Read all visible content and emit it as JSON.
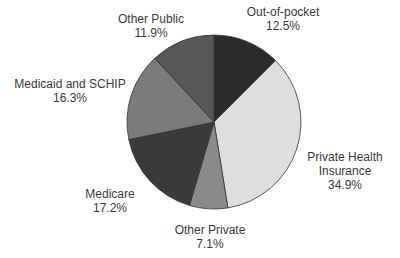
{
  "chart_data": {
    "type": "pie",
    "title": "",
    "start_angle_deg": 0,
    "direction": "clockwise",
    "categories": [
      "Out-of-pocket",
      "Private Health Insurance",
      "Other Private",
      "Medicare",
      "Medicaid and SCHIP",
      "Other Public"
    ],
    "values": [
      12.5,
      34.9,
      7.1,
      17.2,
      16.3,
      11.9
    ],
    "colors": [
      "#2b2b2b",
      "#dedede",
      "#8a8a8a",
      "#3a3a3a",
      "#7b7b7b",
      "#575757"
    ],
    "labels": [
      {
        "name_lines": [
          "Out-of-pocket"
        ],
        "value": "12.5%",
        "x": 283,
        "y": 5
      },
      {
        "name_lines": [
          "Private Health",
          "Insurance"
        ],
        "value": "34.9%",
        "x": 345,
        "y": 150
      },
      {
        "name_lines": [
          "Other Private"
        ],
        "value": "7.1%",
        "x": 210,
        "y": 223
      },
      {
        "name_lines": [
          "Medicare"
        ],
        "value": "17.2%",
        "x": 110,
        "y": 187
      },
      {
        "name_lines": [
          "Medicaid and SCHIP"
        ],
        "value": "16.3%",
        "x": 70,
        "y": 77
      },
      {
        "name_lines": [
          "Other Public"
        ],
        "value": "11.9%",
        "x": 151,
        "y": 12
      }
    ],
    "legend": "none",
    "grid": false
  },
  "labels": {
    "out_of_pocket": {
      "name": "Out-of-pocket",
      "value": "12.5%"
    },
    "private_health_1": "Private Health",
    "private_health_2": "Insurance",
    "private_health_value": "34.9%",
    "other_private": {
      "name": "Other Private",
      "value": "7.1%"
    },
    "medicare": {
      "name": "Medicare",
      "value": "17.2%"
    },
    "medicaid": {
      "name": "Medicaid and SCHIP",
      "value": "16.3%"
    },
    "other_public": {
      "name": "Other Public",
      "value": "11.9%"
    }
  }
}
